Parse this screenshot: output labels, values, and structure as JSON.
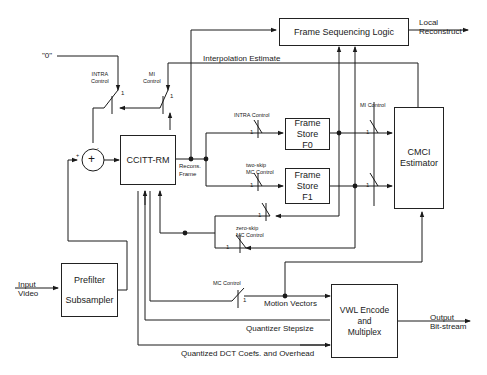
{
  "diagram": {
    "blocks": {
      "frame_sequencing": "Frame Sequencing Logic",
      "ccitt_rm": "CCITT-RM",
      "frame_store_f0": [
        "Frame",
        "Store",
        "F0"
      ],
      "frame_store_f1": [
        "Frame",
        "Store",
        "F1"
      ],
      "cmci_estimator": [
        "CMCI",
        "Estimator"
      ],
      "prefilter": [
        "Prefilter",
        "Subsampler"
      ],
      "vwl_encode": [
        "VWL Encode",
        "and",
        "Multiplex"
      ]
    },
    "signals": {
      "zero_input": "\"0\"",
      "interpolation_estimate": "Interpolation Estimate",
      "local_reconstruct": [
        "Local",
        "Reconstruct"
      ],
      "recons_frame": [
        "Recons.",
        "Frame"
      ],
      "input_video": [
        "Input",
        "Video"
      ],
      "motion_vectors": "Motion Vectors",
      "quantizer_stepsize": "Quantizer Stepsize",
      "quantized_dct": "Quantized  DCT Coefs. and Overhead",
      "output_bitstream": [
        "Output",
        "Bit-stream"
      ]
    },
    "switches": {
      "intra_control_left": [
        "INTRA",
        "Control"
      ],
      "mi_control_left": [
        "MI",
        "Control"
      ],
      "intra_control_f0": "INTRA Control",
      "two_skip": [
        "two-skip",
        "MC Control"
      ],
      "zero_skip": [
        "zero-skip",
        "MC Control"
      ],
      "mi_control_right": "MI Control",
      "mc_control": "MC Control",
      "position_label": "1"
    },
    "summer": {
      "symbol": "+",
      "plus_sign": "+",
      "minus_sign": "-"
    }
  }
}
